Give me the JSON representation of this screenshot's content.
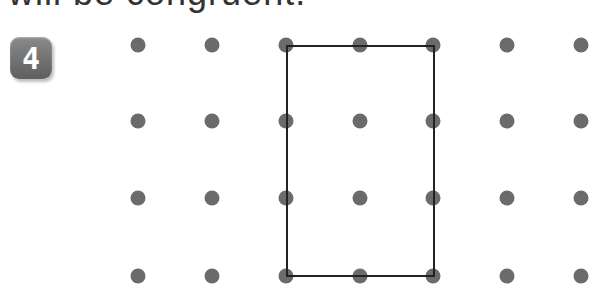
{
  "heading": "will be congruent.",
  "problem_number": "4",
  "grid": {
    "columns_x": [
      138,
      212,
      286,
      360,
      433,
      507,
      581
    ],
    "rows_y": [
      45,
      121,
      198,
      276
    ],
    "dot_radius": 7.5,
    "dot_color": "#6b6b6b"
  },
  "rectangle": {
    "x1": 287,
    "y1": 46,
    "x2": 434,
    "y2": 276,
    "stroke": "#222222",
    "stroke_width": 2
  }
}
